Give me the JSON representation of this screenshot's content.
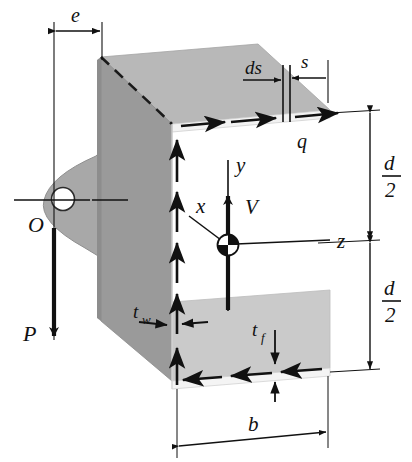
{
  "figure": {
    "type": "engineering-diagram",
    "background_color": "#ffffff",
    "line_color": "#111111",
    "web_face_color": "#9a9a9a",
    "web_side_color": "#8a8a8a",
    "top_flange_color": "#b8b8b8",
    "bottom_flange_color": "#c9c9c9",
    "lug_color": "#a8a8a8"
  },
  "labels": {
    "e": "e",
    "s": "s",
    "ds": "ds",
    "q": "q",
    "O": "O",
    "P": "P",
    "V": "V",
    "x": "x",
    "y": "y",
    "z": "z",
    "b": "b",
    "t_w_base": "t",
    "t_w_sub": "w",
    "t_f_base": "t",
    "t_f_sub": "f",
    "d_upper_num": "d",
    "d_upper_den": "2",
    "d_lower_num": "d",
    "d_lower_den": "2"
  },
  "annotations": {
    "eccentricity_label": "e",
    "coordinate_axes": [
      "x",
      "y",
      "z"
    ],
    "shear_force_label": "V",
    "applied_load_label": "P",
    "shear_center_label": "O",
    "shear_flow_label": "q",
    "element_width_label": "ds",
    "arc_coordinate_label": "s",
    "flange_width_label": "b",
    "web_thickness_label": "tw",
    "flange_thickness_label": "tf",
    "half_depth_label": "d/2"
  },
  "arrow_counts": {
    "top_flange_shear_arrows": 3,
    "web_shear_arrows": 5,
    "bottom_flange_shear_arrows": 3
  }
}
